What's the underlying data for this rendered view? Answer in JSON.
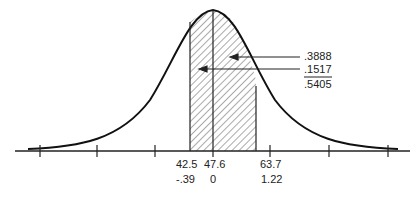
{
  "diagram": {
    "type": "normal-distribution-area",
    "mean_label": "47.6",
    "mean_z": "0",
    "left_bound": {
      "x": "42.5",
      "z": "-.39"
    },
    "right_bound": {
      "x": "63.7",
      "z": "1.22"
    },
    "areas": {
      "right_part": ".3888",
      "left_part": ".1517",
      "total": ".5405"
    },
    "colors": {
      "line": "#222222",
      "hatch": "#444444",
      "background": "#ffffff"
    }
  }
}
